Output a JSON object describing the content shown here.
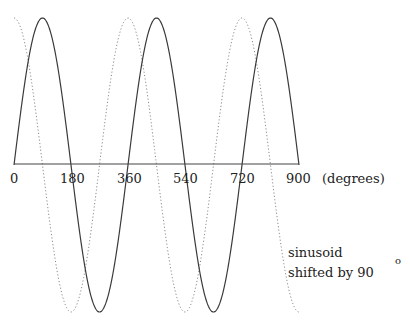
{
  "chart_data": {
    "type": "line",
    "title": "",
    "xlabel": "(degrees)",
    "ylabel": "",
    "xlim": [
      0,
      900
    ],
    "ylim": [
      -1,
      1
    ],
    "grid": false,
    "x_ticks": [
      0,
      180,
      360,
      540,
      720,
      900
    ],
    "x_tick_labels": [
      "0",
      "180",
      "360",
      "540",
      "720",
      "900"
    ],
    "series": [
      {
        "name": "sinusoid",
        "style": "solid",
        "function": "sin(x)",
        "x_start": 0,
        "x_end": 900,
        "color": "#333333"
      },
      {
        "name": "sinusoid shifted by 90°",
        "style": "dotted",
        "function": "sin(x + 90)",
        "x_start": 0,
        "x_end": 900,
        "color": "#777777"
      }
    ],
    "annotations": [
      {
        "text": "sinusoid",
        "line": 1
      },
      {
        "text": "shifted by 90",
        "line": 2,
        "superscript": "o"
      }
    ]
  },
  "labels": {
    "tick_0": "0",
    "tick_180": "180",
    "tick_360": "360",
    "tick_540": "540",
    "tick_720": "720",
    "tick_900": "900",
    "axis_unit": "(degrees)",
    "annotation_line1": "sinusoid",
    "annotation_line2": "shifted by 90",
    "annotation_sup": "o"
  }
}
